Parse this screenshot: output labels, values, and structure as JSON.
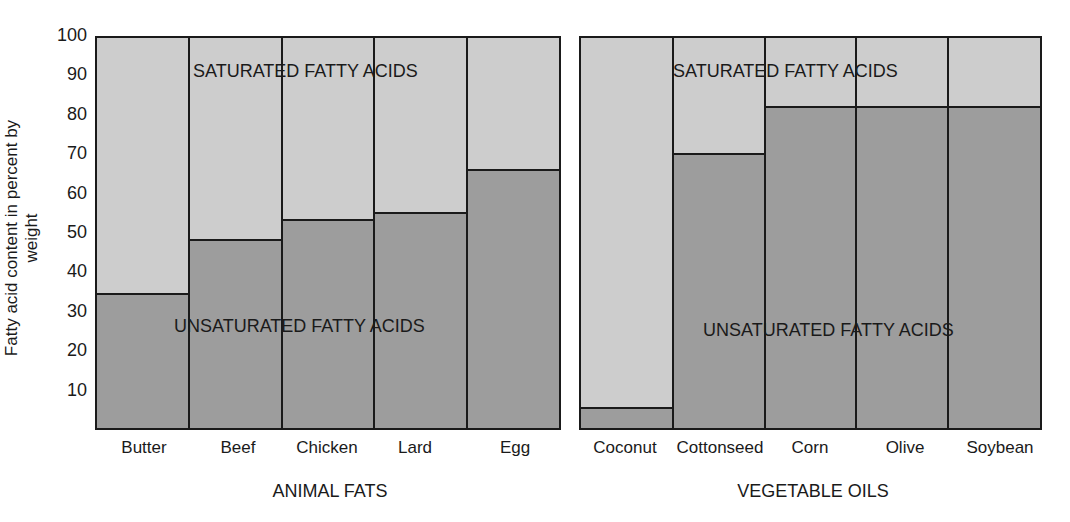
{
  "chart_data": [
    {
      "type": "bar",
      "stacked": true,
      "title": "ANIMAL FATS",
      "categories": [
        "Butter",
        "Beef",
        "Chicken",
        "Lard",
        "Egg"
      ],
      "series": [
        {
          "name": "UNSATURATED FATTY ACIDS",
          "values": [
            34,
            48,
            53,
            55,
            66
          ],
          "color": "#9d9d9d"
        },
        {
          "name": "SATURATED FATTY ACIDS",
          "values": [
            66,
            52,
            47,
            45,
            34
          ],
          "color": "#cdcdcd"
        }
      ],
      "xlabel": "ANIMAL FATS",
      "ylabel": "Fatty acid content in percent by weight",
      "ylim": [
        0,
        100
      ],
      "yticks": [
        10,
        20,
        30,
        40,
        50,
        60,
        70,
        80,
        90,
        100
      ],
      "grid": false
    },
    {
      "type": "bar",
      "stacked": true,
      "title": "VEGETABLE OILS",
      "categories": [
        "Coconut",
        "Cottonseed",
        "Corn",
        "Olive",
        "Soybean"
      ],
      "series": [
        {
          "name": "UNSATURATED FATTY ACIDS",
          "values": [
            5,
            70,
            82,
            82,
            82
          ],
          "color": "#9d9d9d"
        },
        {
          "name": "SATURATED FATTY ACIDS",
          "values": [
            95,
            30,
            18,
            18,
            18
          ],
          "color": "#cdcdcd"
        }
      ],
      "xlabel": "VEGETABLE OILS",
      "ylabel": "Fatty acid content in percent by weight",
      "ylim": [
        0,
        100
      ],
      "grid": false
    }
  ],
  "labels": {
    "ylabel": "Fatty acid content in percent by weight",
    "yticks": [
      "100",
      "90",
      "80",
      "70",
      "60",
      "50",
      "40",
      "30",
      "20",
      "10"
    ],
    "saturated": "SATURATED FATTY ACIDS",
    "unsaturated": "UNSATURATED FATTY ACIDS",
    "animal": {
      "group": "ANIMAL FATS",
      "cats": [
        "Butter",
        "Beef",
        "Chicken",
        "Lard",
        "Egg"
      ]
    },
    "vegetable": {
      "group": "VEGETABLE OILS",
      "cats": [
        "Coconut",
        "Cottonseed",
        "Corn",
        "Olive",
        "Soybean"
      ]
    }
  }
}
